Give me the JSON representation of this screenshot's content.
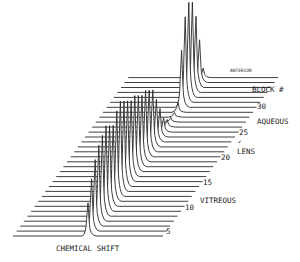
{
  "chart_data": {
    "type": "line",
    "subtype": "stacked-waterfall",
    "title": "",
    "xlabel": "CHEMICAL SHIFT",
    "depth_axis_label": "BLOCK #",
    "depth_ticks": [
      5,
      10,
      15,
      20,
      25,
      30
    ],
    "blocks": [
      1,
      2,
      3,
      4,
      5,
      6,
      7,
      8,
      9,
      10,
      11,
      12,
      13,
      14,
      15,
      16,
      17,
      18,
      19,
      20,
      21,
      22,
      23,
      24,
      25,
      26,
      27,
      28,
      29,
      30,
      31,
      32,
      33
    ],
    "peak_relative_height": [
      0.35,
      0.55,
      0.7,
      0.8,
      0.85,
      0.9,
      0.85,
      0.8,
      0.9,
      0.95,
      0.9,
      0.85,
      0.8,
      0.8,
      0.75,
      0.7,
      0.7,
      0.65,
      0.6,
      0.45,
      0.3,
      0.15,
      0.08,
      0.05,
      0.05,
      0.1,
      0.6,
      0.9,
      1.0,
      0.95,
      0.75,
      0.45,
      0.1
    ],
    "annotations": [
      {
        "text": "ANTERIOR",
        "near_block": 33
      },
      {
        "text": "AQUEOUS",
        "near_block": 28
      },
      {
        "text": "LENS",
        "near_block": 21
      },
      {
        "text": "VITREOUS",
        "near_block": 11
      }
    ],
    "grid": false,
    "legend": "none"
  },
  "labels": {
    "xlabel": "CHEMICAL SHIFT",
    "block": "BLOCK #",
    "anterior": "ANTERIOR",
    "aqueous": "AQUEOUS",
    "lens": "LENS",
    "vitreous": "VITREOUS",
    "arrow": "↙",
    "t5": "5",
    "t10": "10",
    "t15": "15",
    "t20": "20",
    "t25": "25",
    "t30": "30"
  }
}
